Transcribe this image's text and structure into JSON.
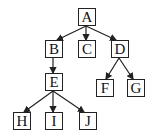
{
  "diagram": {
    "type": "tree",
    "nodes": [
      {
        "id": "A",
        "label": "A",
        "x": 78,
        "y": 8
      },
      {
        "id": "B",
        "label": "B",
        "x": 45,
        "y": 40
      },
      {
        "id": "C",
        "label": "C",
        "x": 78,
        "y": 40
      },
      {
        "id": "D",
        "label": "D",
        "x": 111,
        "y": 40
      },
      {
        "id": "E",
        "label": "E",
        "x": 45,
        "y": 73
      },
      {
        "id": "F",
        "label": "F",
        "x": 96,
        "y": 79
      },
      {
        "id": "G",
        "label": "G",
        "x": 127,
        "y": 79
      },
      {
        "id": "H",
        "label": "H",
        "x": 13,
        "y": 112
      },
      {
        "id": "I",
        "label": "I",
        "x": 45,
        "y": 112
      },
      {
        "id": "J",
        "label": "J",
        "x": 79,
        "y": 112
      }
    ],
    "edges": [
      {
        "from": "A",
        "to": "B"
      },
      {
        "from": "A",
        "to": "C"
      },
      {
        "from": "A",
        "to": "D"
      },
      {
        "from": "B",
        "to": "E"
      },
      {
        "from": "D",
        "to": "F"
      },
      {
        "from": "D",
        "to": "G"
      },
      {
        "from": "E",
        "to": "H"
      },
      {
        "from": "E",
        "to": "I"
      },
      {
        "from": "E",
        "to": "J"
      }
    ],
    "colors": {
      "stroke": "#222222",
      "background": "#ffffff"
    }
  }
}
